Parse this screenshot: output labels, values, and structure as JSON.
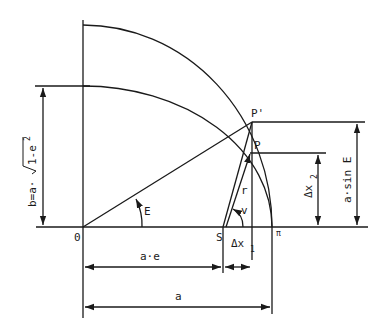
{
  "diagram": {
    "points": {
      "origin": "0",
      "focus": "S",
      "perihelion": "π",
      "point_on_circle": "P'",
      "point_on_ellipse": "P"
    },
    "angles": {
      "eccentric_anomaly": "E",
      "true_anomaly": "v"
    },
    "segments": {
      "radius_vector": "r"
    },
    "dimensions": {
      "semi_minor": "b=a·√1-e²",
      "semi_minor_prefix": "b=a·",
      "semi_minor_radicand": "1-e",
      "semi_minor_exp": "2",
      "focal_distance": "a·e",
      "semi_major": "a",
      "delta_x1": "Δx",
      "delta_x1_sub": "1",
      "delta_x2": "Δx",
      "delta_x2_sub": "2",
      "a_sin_e": "a·sin E"
    }
  }
}
